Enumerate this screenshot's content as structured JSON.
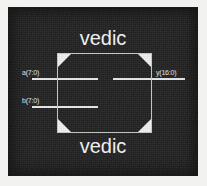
{
  "diagram": {
    "kind": "rtl-schematic-block",
    "background_color": "#232323",
    "line_color": "#c9c9c9",
    "text_color": "#f5f5f5",
    "labels": {
      "module_name_top": "vedic",
      "module_name_bottom": "vedic"
    },
    "ports": {
      "inputs": [
        {
          "id": "a",
          "label": "a(7:0)",
          "width_bits": 8,
          "side": "left"
        },
        {
          "id": "b",
          "label": "b(7:0)",
          "width_bits": 8,
          "side": "left"
        }
      ],
      "outputs": [
        {
          "id": "y",
          "label": "y(16:0)",
          "width_bits": 17,
          "side": "right"
        }
      ]
    },
    "block": {
      "corner_markers": 4,
      "corner_marker_color": "#f0f0f0"
    }
  }
}
